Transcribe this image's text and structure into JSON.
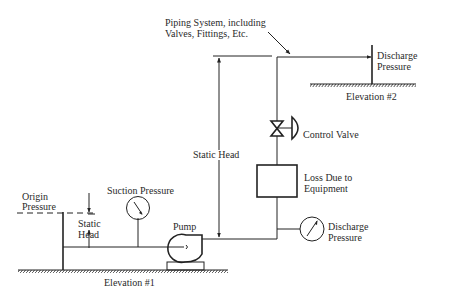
{
  "diagram": {
    "labels": {
      "piping_line1": "Piping System, including",
      "piping_line2": "Valves, Fittings, Etc.",
      "discharge_top_line1": "Discharge",
      "discharge_top_line2": "Pressure",
      "elevation2": "Elevation #2",
      "control_valve": "Control Valve",
      "static_head_main": "Static Head",
      "loss_line1": "Loss Due to",
      "loss_line2": "Equipment",
      "origin_line1": "Origin",
      "origin_line2": "Pressure",
      "suction_pressure": "Suction Pressure",
      "static_head_left_line1": "Static",
      "static_head_left_line2": "Head",
      "pump": "Pump",
      "discharge_gauge_line1": "Discharge",
      "discharge_gauge_line2": "Pressure",
      "elevation1": "Elevation #1"
    },
    "colors": {
      "line": "#222222",
      "text": "#2a2a2a",
      "background": "#ffffff"
    }
  }
}
